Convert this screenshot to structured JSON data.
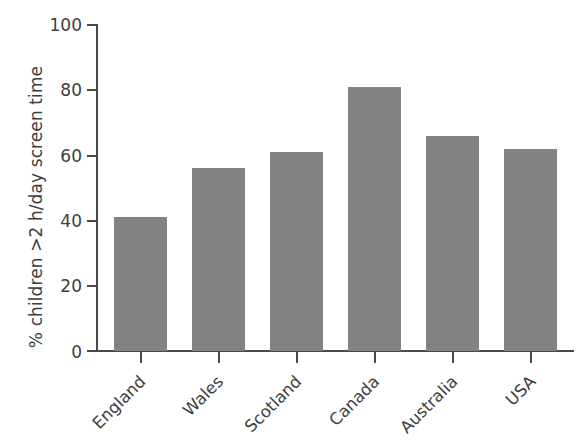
{
  "chart_data": {
    "type": "bar",
    "title": "",
    "subtitle": "",
    "xlabel": "",
    "ylabel": "% children >2 h/day screen time",
    "categories": [
      "England",
      "Wales",
      "Scotland",
      "Canada",
      "Australia",
      "USA"
    ],
    "values": [
      41,
      56,
      61,
      81,
      66,
      62
    ],
    "ylim": [
      0,
      100
    ],
    "yticks": [
      0,
      20,
      40,
      60,
      80,
      100
    ],
    "ytick_labels": [
      "0",
      "20",
      "40",
      "60",
      "80",
      "100"
    ],
    "grid": false,
    "legend": false,
    "legend_position": "none",
    "series": [
      {
        "name": "% children >2 h/day screen time",
        "values": [
          41,
          56,
          61,
          81,
          66,
          62
        ]
      }
    ],
    "annotations": [],
    "colors": {
      "bar_fill": "#828282",
      "axis": "#4a4a4a",
      "text": "#3d3d3d",
      "background": "#ffffff"
    },
    "xlabel_rotation": -45
  }
}
